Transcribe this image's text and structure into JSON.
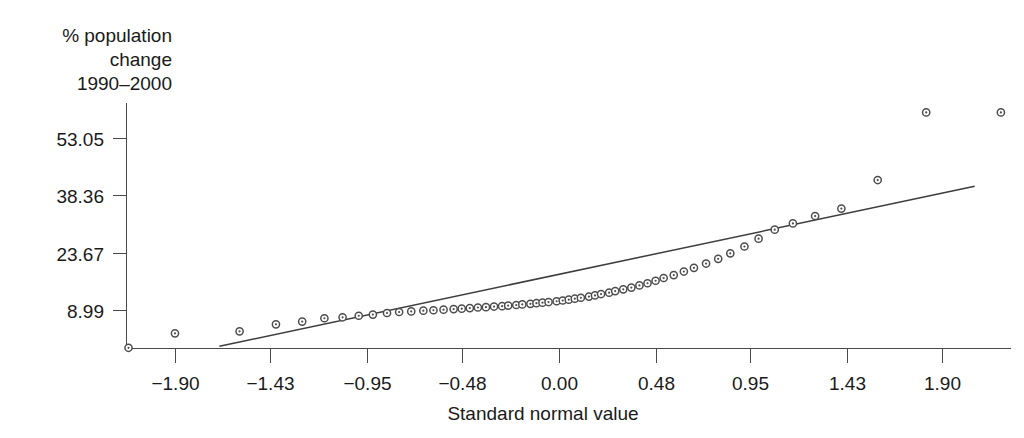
{
  "chart_data": {
    "type": "scatter",
    "title": "",
    "subtitle": "",
    "xlabel": "Standard normal value",
    "ylabel": "% population change 1990–2000",
    "ylabel_lines": [
      "% population",
      "change",
      "1990–2000"
    ],
    "xlim": [
      -2.14,
      2.24
    ],
    "ylim": [
      -0.78,
      62.0
    ],
    "xticks": [
      -1.9,
      -1.43,
      -0.95,
      -0.48,
      0.0,
      0.48,
      0.95,
      1.43,
      1.9
    ],
    "xticklabels": [
      "−1.90",
      "−1.43",
      "−0.95",
      "−0.48",
      "0.00",
      "0.48",
      "0.95",
      "1.43",
      "1.90"
    ],
    "yticks": [
      8.99,
      23.67,
      38.36,
      53.05
    ],
    "yticklabels": [
      "8.99",
      "23.67",
      "38.36",
      "53.05"
    ],
    "grid": false,
    "legend": null,
    "marker": "open-circle",
    "series": [
      {
        "name": "% population change 1990-2000",
        "x": [
          -2.13,
          -1.9,
          -1.58,
          -1.4,
          -1.27,
          -1.16,
          -1.07,
          -0.99,
          -0.92,
          -0.85,
          -0.79,
          -0.73,
          -0.67,
          -0.62,
          -0.57,
          -0.52,
          -0.48,
          -0.44,
          -0.4,
          -0.36,
          -0.32,
          -0.28,
          -0.25,
          -0.21,
          -0.18,
          -0.14,
          -0.11,
          -0.08,
          -0.05,
          -0.01,
          0.02,
          0.05,
          0.08,
          0.11,
          0.15,
          0.18,
          0.21,
          0.25,
          0.28,
          0.32,
          0.36,
          0.4,
          0.44,
          0.48,
          0.52,
          0.57,
          0.62,
          0.67,
          0.73,
          0.79,
          0.85,
          0.92,
          0.99,
          1.07,
          1.16,
          1.27,
          1.4,
          1.58,
          1.82,
          2.19
        ],
        "y": [
          -0.6,
          3.1,
          3.6,
          5.4,
          6.1,
          6.95,
          7.2,
          7.6,
          7.9,
          8.3,
          8.55,
          8.7,
          8.9,
          9.0,
          9.15,
          9.3,
          9.4,
          9.55,
          9.7,
          9.8,
          9.95,
          10.05,
          10.2,
          10.35,
          10.5,
          10.65,
          10.8,
          10.95,
          11.1,
          11.3,
          11.5,
          11.7,
          11.95,
          12.2,
          12.5,
          12.8,
          13.15,
          13.5,
          13.9,
          14.35,
          14.8,
          15.35,
          15.9,
          16.55,
          17.25,
          18.0,
          18.9,
          19.85,
          20.95,
          22.15,
          23.55,
          25.3,
          27.3,
          29.6,
          31.2,
          33.1,
          35.0,
          42.3,
          59.6,
          59.6
        ]
      }
    ],
    "reference_line": {
      "name": "normal-reference-line",
      "x_start": -1.68,
      "y_start": -0.2,
      "x_end": 2.06,
      "y_end": 40.7
    }
  },
  "axes": {
    "x_axis_name": "x-axis",
    "y_axis_name": "y-axis"
  }
}
